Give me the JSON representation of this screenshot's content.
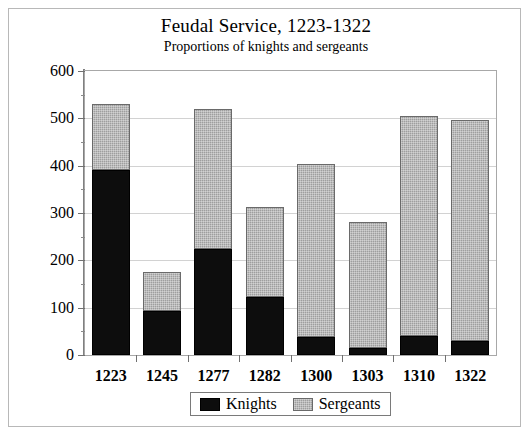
{
  "chart_data": {
    "type": "bar",
    "title": "Feudal Service, 1223-1322",
    "subtitle": "Proportions of knights and sergeants",
    "xlabel": "",
    "ylabel": "",
    "stacked": true,
    "grid": true,
    "legend_position": "bottom",
    "ylim": [
      0,
      600
    ],
    "ytick_step": 100,
    "yminor_step": 50,
    "yticks": [
      0,
      100,
      200,
      300,
      400,
      500,
      600
    ],
    "ytick_labels": [
      "0",
      "100",
      "200",
      "300",
      "400",
      "500",
      "600"
    ],
    "categories": [
      "1223",
      "1245",
      "1277",
      "1282",
      "1300",
      "1303",
      "1310",
      "1322"
    ],
    "series": [
      {
        "name": "Knights",
        "color": "#0d0d0d",
        "values": [
          390,
          92,
          225,
          122,
          38,
          14,
          40,
          30
        ]
      },
      {
        "name": "Sergeants",
        "color": "#9e9e9e",
        "values": [
          140,
          83,
          295,
          191,
          365,
          266,
          465,
          467
        ]
      }
    ],
    "totals": [
      530,
      175,
      520,
      313,
      403,
      280,
      505,
      497
    ]
  },
  "legend": {
    "items": [
      {
        "label": "Knights",
        "swatch": "knights"
      },
      {
        "label": "Sergeants",
        "swatch": "sergeants"
      }
    ]
  }
}
